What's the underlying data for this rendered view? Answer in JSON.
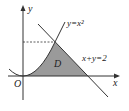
{
  "diagram": {
    "axes": {
      "x_label": "x",
      "y_label": "y",
      "origin_label": "O"
    },
    "curves": [
      {
        "name": "parabola",
        "label": "y=x²",
        "equation": "y=x^2"
      },
      {
        "name": "line",
        "label": "x+y=2",
        "equation": "x+y=2"
      }
    ],
    "region_label": "D",
    "intersection": {
      "x": 1,
      "y": 1
    },
    "colors": {
      "region_fill": "#9a9a9a",
      "stroke": "#333333"
    }
  }
}
